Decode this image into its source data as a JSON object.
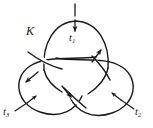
{
  "figure": {
    "type": "knot-diagram",
    "background_color": "#ffffff",
    "stroke_color": "#1a1a1a",
    "stroke_width": 1.4,
    "width": 153,
    "height": 128
  },
  "labels": {
    "knot": {
      "text": "K",
      "base": "K",
      "subscript": "",
      "x": 26,
      "y": 25,
      "style": "italic"
    },
    "tangle_1": {
      "text": "t1",
      "base": "t",
      "subscript": "1",
      "x": 69,
      "y": 33,
      "style": "italic"
    },
    "tangle_2": {
      "text": "t2",
      "base": "t",
      "subscript": "2",
      "x": 135,
      "y": 107,
      "style": "italic"
    },
    "tangle_3": {
      "text": "t3",
      "base": "t",
      "subscript": "3",
      "x": 3,
      "y": 107,
      "style": "italic"
    }
  },
  "markers": {
    "top_tick": {
      "name": "top-tick-mark",
      "x1": 75,
      "y1": 4,
      "x2": 75,
      "y2": 17
    },
    "leader_t1": {
      "name": "leader-line-t1",
      "x1": 75,
      "y1": 19,
      "x2": 75,
      "y2": 32,
      "arrow": "down"
    },
    "leader_t2": {
      "name": "leader-line-t2",
      "x1": 133,
      "y1": 108,
      "x2": 118,
      "y2": 98,
      "arrow": "up-left"
    },
    "leader_t3": {
      "name": "leader-line-t3",
      "x1": 16,
      "y1": 110,
      "x2": 32,
      "y2": 100,
      "arrow": "up-right"
    }
  },
  "orientation_arrows": [
    {
      "name": "orientation-arrow-upper-right",
      "x": 100,
      "y": 52,
      "direction": "up-right"
    },
    {
      "name": "orientation-arrow-left",
      "x": 28,
      "y": 80,
      "direction": "down-left"
    },
    {
      "name": "orientation-arrow-bottom-center",
      "x": 70,
      "y": 95,
      "direction": "down-right"
    }
  ],
  "crossings": [
    {
      "name": "crossing-left",
      "x": 50,
      "y": 62,
      "over": "lower-left-lobe"
    },
    {
      "name": "crossing-right",
      "x": 101,
      "y": 60,
      "over": "lower-right-lobe"
    },
    {
      "name": "crossing-bottom",
      "x": 76,
      "y": 99,
      "over": "lower-left-lobe"
    }
  ]
}
